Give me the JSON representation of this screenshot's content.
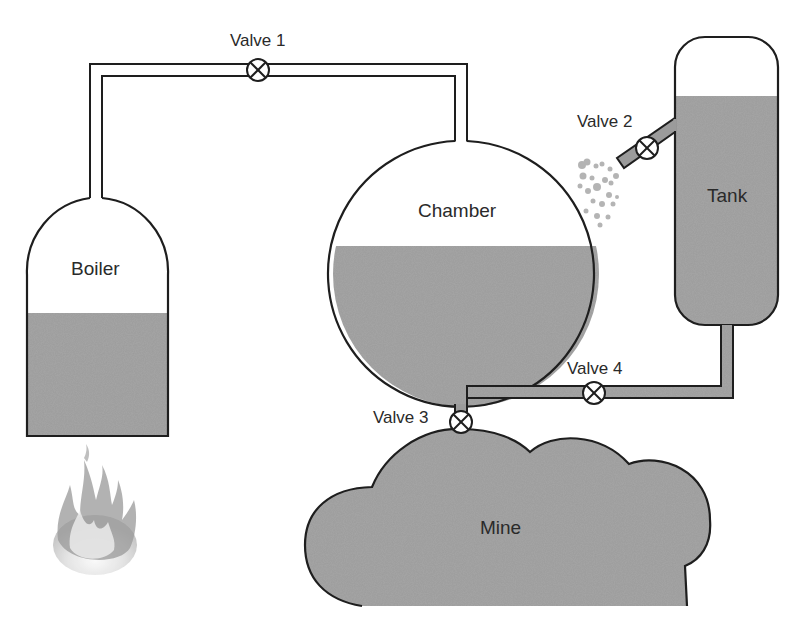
{
  "diagram": {
    "title": "",
    "colors": {
      "fluid": "#9b9b9b",
      "outline": "#1e1e1e",
      "background": "#ffffff",
      "bubbles": "#a8a8a8",
      "flame": "#8e8e8e"
    },
    "components": {
      "boiler": {
        "label": "Boiler"
      },
      "chamber": {
        "label": "Chamber"
      },
      "tank": {
        "label": "Tank"
      },
      "mine": {
        "label": "Mine"
      }
    },
    "valves": [
      {
        "id": "valve1",
        "label": "Valve 1"
      },
      {
        "id": "valve2",
        "label": "Valve 2"
      },
      {
        "id": "valve3",
        "label": "Valve 3"
      },
      {
        "id": "valve4",
        "label": "Valve 4"
      }
    ],
    "icons": {
      "valve": "circle-x-valve-icon",
      "fire": "fire-icon",
      "bubbles": "gas-bubbles-icon"
    }
  }
}
